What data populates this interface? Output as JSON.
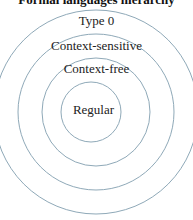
{
  "title": "Formal languages hierarchy",
  "diagram": {
    "type": "nested-circles",
    "stroke_color": "#8fa9b8",
    "levels": [
      {
        "label": "Type 0",
        "radius": 102
      },
      {
        "label": "Context-sensitive",
        "radius": 78
      },
      {
        "label": "Context-free",
        "radius": 54
      },
      {
        "label": "Regular",
        "radius": 30
      }
    ]
  }
}
